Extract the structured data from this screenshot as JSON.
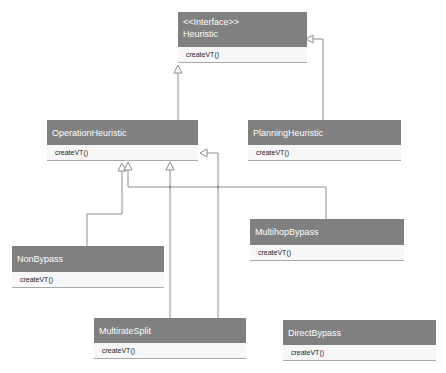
{
  "diagram": {
    "type": "uml-class",
    "classes": [
      {
        "id": "heuristic",
        "stereotype": "<<Interface>>",
        "name": "Heuristic",
        "operations": [
          "createVT()"
        ]
      },
      {
        "id": "operation",
        "name": "OperationHeuristic",
        "operations": [
          "createVT()"
        ]
      },
      {
        "id": "planning",
        "name": "PlanningHeuristic",
        "operations": [
          "createVT()"
        ]
      },
      {
        "id": "multihop",
        "name": "MultihopBypass",
        "operations": [
          "createVT()"
        ]
      },
      {
        "id": "nonbypass",
        "name": "NonBypass",
        "operations": [
          "createVT()"
        ]
      },
      {
        "id": "multirate",
        "name": "MultirateSplit",
        "operations": [
          "createVT()"
        ]
      },
      {
        "id": "direct",
        "name": "DirectBypass",
        "operations": [
          "createVT()"
        ]
      }
    ],
    "relations": [
      {
        "from": "OperationHeuristic",
        "to": "Heuristic",
        "type": "realization"
      },
      {
        "from": "PlanningHeuristic",
        "to": "Heuristic",
        "type": "realization"
      },
      {
        "from": "NonBypass",
        "to": "OperationHeuristic",
        "type": "generalization"
      },
      {
        "from": "MultihopBypass",
        "to": "OperationHeuristic",
        "type": "generalization"
      },
      {
        "from": "MultirateSplit",
        "to": "OperationHeuristic",
        "type": "generalization"
      },
      {
        "from": "DirectBypass",
        "to": "OperationHeuristic",
        "type": "generalization"
      }
    ],
    "colors": {
      "header": "#808080",
      "header_text": "#ffffff",
      "body": "#f7f7f7",
      "line": "#8c8c8c"
    }
  }
}
